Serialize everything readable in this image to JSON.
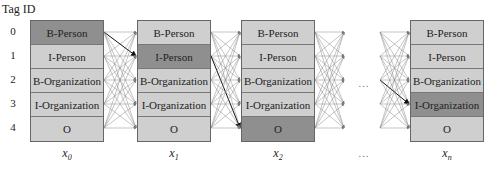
{
  "diagram": {
    "title": "Tag ID",
    "tag_ids": [
      "0",
      "1",
      "2",
      "3",
      "4"
    ],
    "tags": [
      "B-Person",
      "I-Person",
      "B-Organization",
      "I-Organization",
      "O"
    ],
    "columns": [
      {
        "label": "x",
        "subscript": "0",
        "active_index": 0
      },
      {
        "label": "x",
        "subscript": "1",
        "active_index": 1
      },
      {
        "label": "x",
        "subscript": "2",
        "active_index": 4
      },
      {
        "label": "x",
        "subscript": "n",
        "active_index": 3
      }
    ],
    "ellipsis": "…",
    "colors": {
      "cell_fill": "#cfcfcf",
      "active_fill": "#8f8f8f",
      "edge": "#8a8a8a",
      "best_path_edge": "#111111",
      "border": "#666666"
    }
  }
}
